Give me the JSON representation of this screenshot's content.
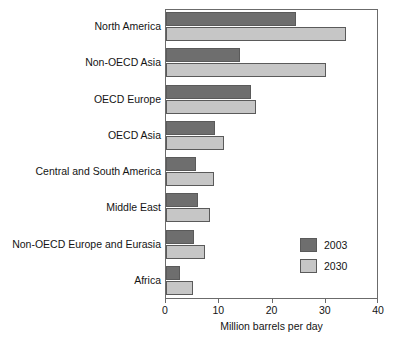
{
  "chart_data": {
    "type": "bar",
    "orientation": "horizontal",
    "title": "",
    "xlabel": "Million barrels per day",
    "ylabel": "",
    "xlim": [
      0,
      40
    ],
    "xticks": [
      0,
      10,
      20,
      30,
      40
    ],
    "xtick_labels": [
      "0",
      "10",
      "20",
      "30",
      "40"
    ],
    "grid": false,
    "legend_position": "inside-right-lower",
    "categories": [
      "North America",
      "Non-OECD Asia",
      "OECD Europe",
      "OECD Asia",
      "Central and South America",
      "Middle East",
      "Non-OECD Europe and Eurasia",
      "Africa"
    ],
    "series": [
      {
        "name": "2003",
        "color": "#6e6e6e",
        "values": [
          24.4,
          13.9,
          15.9,
          9.2,
          5.6,
          6.0,
          5.3,
          2.6
        ]
      },
      {
        "name": "2030",
        "color": "#c6c6c6",
        "values": [
          33.8,
          30.0,
          16.9,
          10.9,
          9.0,
          8.3,
          7.3,
          5.1
        ]
      }
    ]
  },
  "legend": {
    "entries": [
      {
        "label": "2003",
        "color": "#6e6e6e"
      },
      {
        "label": "2030",
        "color": "#c6c6c6"
      }
    ]
  },
  "axes": {
    "x_title": "Million barrels per day"
  }
}
